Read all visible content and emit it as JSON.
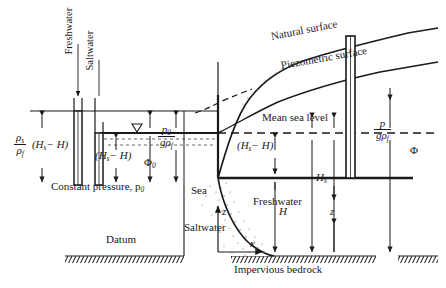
{
  "figure": {
    "colors": {
      "ink": "#1a1a1a",
      "stipple": "#6b6b6b",
      "paper": "#ffffff"
    }
  },
  "callouts": {
    "freshwater_tube": "Freshwater",
    "saltwater_tube": "Saltwater"
  },
  "labels": {
    "constant_pressure": "Constant pressure, p",
    "constant_pressure_sub": "0",
    "sea": "Sea",
    "saltwater": "Saltwater",
    "freshwater": "Freshwater",
    "datum": "Datum",
    "impervious_bedrock": "Impervious bedrock",
    "natural_surface": "Natural surface",
    "piezometric_surface": "Piezometric surface",
    "mean_sea_level": "Mean sea level"
  },
  "symbols": {
    "rho_s": "ρ",
    "rho_s_sub": "s",
    "rho_f": "ρ",
    "rho_f_sub": "f",
    "hs_minus_h": "(H",
    "hs_minus_h_sub": "s",
    "hs_minus_h_tail": "− H)",
    "phi_zero": "Φ",
    "phi_zero_sub": "0",
    "phi": "Φ",
    "p_zero_num": "p",
    "p_zero_num_sub": "0",
    "p_zero_den_g": "g",
    "p_zero_den_rho": "ρ",
    "p_zero_den_sub": "f",
    "p_num": "p",
    "p_den_g": "g",
    "p_den_rho": "ρ",
    "p_den_sub": "f",
    "H_s": "H",
    "H_s_sub": "s",
    "H": "H",
    "z": "z",
    "x": "x"
  }
}
